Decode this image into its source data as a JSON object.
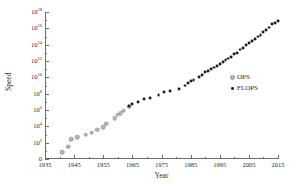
{
  "chart_data": {
    "type": "scatter",
    "title": "",
    "xlabel": "Year",
    "ylabel": "Speed",
    "xlim": [
      1935,
      2015
    ],
    "ylim_log10": [
      0,
      18
    ],
    "yscale": "log",
    "grid": false,
    "legend_position": "right-center",
    "x_ticks_major": [
      1935,
      1945,
      1955,
      1965,
      1975,
      1985,
      1995,
      2005,
      2015
    ],
    "x_tick_labels": [
      "1935",
      "1945",
      "1955",
      "1965",
      "1975",
      "1985",
      "1995",
      "2005",
      "2015"
    ],
    "x_ticks_minor": [
      1940,
      1950,
      1960,
      1970,
      1980,
      1990,
      2000,
      2010
    ],
    "y_ticks_major_log10": [
      0,
      2,
      4,
      6,
      8,
      10,
      12,
      14,
      16,
      18
    ],
    "y_tick_labels": [
      "0",
      "10^2",
      "10^4",
      "10^6",
      "10^8",
      "10^10",
      "10^12",
      "10^14",
      "10^16",
      "10^18"
    ],
    "y_tick_mantissa": [
      "0",
      "10",
      "10",
      "10",
      "10",
      "10",
      "10",
      "10",
      "10",
      "10"
    ],
    "y_tick_exponent": [
      "",
      "2",
      "4",
      "6",
      "8",
      "10",
      "12",
      "14",
      "16",
      "18"
    ],
    "y_ticks_minor_log10": [
      1,
      3,
      5,
      7,
      9,
      11,
      13,
      15,
      17
    ],
    "series": [
      {
        "name": "OPS",
        "marker": "open-circle",
        "color": "#b9b9b9",
        "points": [
          {
            "x": 1941,
            "y_log10": 0.8
          },
          {
            "x": 1943,
            "y_log10": 1.5
          },
          {
            "x": 1944,
            "y_log10": 2.4
          },
          {
            "x": 1946,
            "y_log10": 2.7
          },
          {
            "x": 1949,
            "y_log10": 3.0
          },
          {
            "x": 1951,
            "y_log10": 3.2
          },
          {
            "x": 1953,
            "y_log10": 3.6
          },
          {
            "x": 1955,
            "y_log10": 3.9
          },
          {
            "x": 1956,
            "y_log10": 4.3
          },
          {
            "x": 1959,
            "y_log10": 5.0
          },
          {
            "x": 1960,
            "y_log10": 5.4
          },
          {
            "x": 1961,
            "y_log10": 5.6
          },
          {
            "x": 1962,
            "y_log10": 5.9
          },
          {
            "x": 1964,
            "y_log10": 6.4
          }
        ]
      },
      {
        "name": "FLOPS",
        "marker": "filled-circle",
        "color": "#1c1c1c",
        "points": [
          {
            "x": 1964,
            "y_log10": 6.5
          },
          {
            "x": 1965,
            "y_log10": 6.7
          },
          {
            "x": 1967,
            "y_log10": 7.0
          },
          {
            "x": 1969,
            "y_log10": 7.3
          },
          {
            "x": 1971,
            "y_log10": 7.5
          },
          {
            "x": 1974,
            "y_log10": 7.8
          },
          {
            "x": 1976,
            "y_log10": 8.2
          },
          {
            "x": 1978,
            "y_log10": 8.3
          },
          {
            "x": 1981,
            "y_log10": 8.6
          },
          {
            "x": 1983,
            "y_log10": 9.0
          },
          {
            "x": 1984,
            "y_log10": 9.3
          },
          {
            "x": 1985,
            "y_log10": 9.5
          },
          {
            "x": 1986,
            "y_log10": 9.7
          },
          {
            "x": 1988,
            "y_log10": 10.0
          },
          {
            "x": 1989,
            "y_log10": 10.3
          },
          {
            "x": 1990,
            "y_log10": 10.6
          },
          {
            "x": 1991,
            "y_log10": 10.8
          },
          {
            "x": 1992,
            "y_log10": 11.0
          },
          {
            "x": 1993,
            "y_log10": 11.2
          },
          {
            "x": 1994,
            "y_log10": 11.4
          },
          {
            "x": 1995,
            "y_log10": 11.6
          },
          {
            "x": 1996,
            "y_log10": 11.9
          },
          {
            "x": 1997,
            "y_log10": 12.1
          },
          {
            "x": 1998,
            "y_log10": 12.3
          },
          {
            "x": 1999,
            "y_log10": 12.5
          },
          {
            "x": 2000,
            "y_log10": 12.8
          },
          {
            "x": 2001,
            "y_log10": 13.0
          },
          {
            "x": 2002,
            "y_log10": 13.4
          },
          {
            "x": 2003,
            "y_log10": 13.6
          },
          {
            "x": 2004,
            "y_log10": 13.9
          },
          {
            "x": 2005,
            "y_log10": 14.2
          },
          {
            "x": 2006,
            "y_log10": 14.4
          },
          {
            "x": 2007,
            "y_log10": 14.7
          },
          {
            "x": 2008,
            "y_log10": 15.0
          },
          {
            "x": 2009,
            "y_log10": 15.2
          },
          {
            "x": 2010,
            "y_log10": 15.5
          },
          {
            "x": 2011,
            "y_log10": 15.8
          },
          {
            "x": 2012,
            "y_log10": 16.1
          },
          {
            "x": 2013,
            "y_log10": 16.5
          },
          {
            "x": 2014,
            "y_log10": 16.7
          },
          {
            "x": 2015,
            "y_log10": 16.9
          }
        ]
      }
    ]
  },
  "legend": {
    "items": [
      {
        "label": "OPS",
        "marker": "open-circle"
      },
      {
        "label": "FLOPS",
        "marker": "filled-circle"
      }
    ]
  }
}
